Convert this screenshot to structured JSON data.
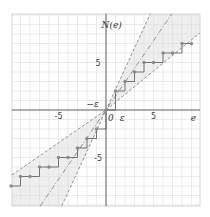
{
  "chart_data": {
    "type": "line",
    "title": "",
    "xlabel": "e",
    "ylabel": "N(e)",
    "xlim": [
      -9.9,
      9.9
    ],
    "ylim": [
      -10.1,
      10.1
    ],
    "grid": true,
    "x_ticks": [
      {
        "value": -5,
        "label": "-5"
      },
      {
        "value": 5,
        "label": "5"
      }
    ],
    "y_ticks": [
      {
        "value": 5,
        "label": "5"
      },
      {
        "value": -5,
        "label": "-5"
      }
    ],
    "annotations": [
      {
        "text": "−ε",
        "e": -1.4,
        "N": 0.6
      },
      {
        "text": "0",
        "e": 0.5,
        "N": -0.8
      },
      {
        "text": "ε",
        "e": 1.7,
        "N": -0.8
      },
      {
        "text": "e",
        "e": 9.2,
        "N": -0.8
      },
      {
        "text": "N(e)",
        "e": 0.6,
        "N": 9.0
      }
    ],
    "lines": [
      {
        "name": "steep-bound",
        "slope": 2.17,
        "intercept": 0,
        "style": "dashed"
      },
      {
        "name": "middle-line",
        "slope": 1.46,
        "intercept": 0,
        "style": "dashdot"
      },
      {
        "name": "shallow-bound-upper",
        "slope": 0.82,
        "intercept": 0,
        "style": "dashed"
      },
      {
        "name": "shallow-bound-lower",
        "slope": 0.69,
        "intercept": 0,
        "style": "dashed"
      }
    ],
    "series": [
      {
        "name": "N(e) staircase",
        "points": [
          [
            -10,
            -8
          ],
          [
            -9,
            -7
          ],
          [
            -8,
            -7
          ],
          [
            -7,
            -6
          ],
          [
            -6,
            -6
          ],
          [
            -5,
            -5
          ],
          [
            -4,
            -5
          ],
          [
            -3,
            -4
          ],
          [
            -2,
            -3
          ],
          [
            -1,
            -2
          ],
          [
            0,
            0
          ],
          [
            1,
            2
          ],
          [
            2,
            3
          ],
          [
            3,
            4
          ],
          [
            4,
            5
          ],
          [
            5,
            5
          ],
          [
            6,
            6
          ],
          [
            7,
            6
          ],
          [
            8,
            7
          ],
          [
            9,
            7
          ]
        ]
      }
    ]
  },
  "colors": {
    "grid": "#dddddd",
    "axis": "#555555",
    "shade": "#eeeeee",
    "line": "#888888",
    "dot": "#8a8a8a",
    "step": "#555555"
  }
}
